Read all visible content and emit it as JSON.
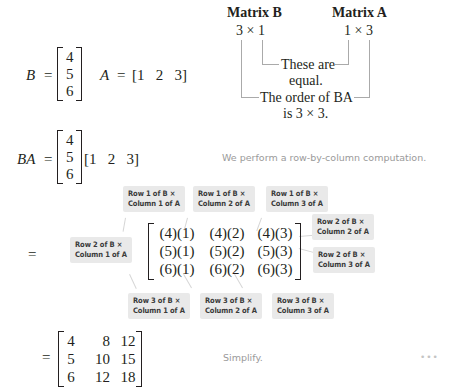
{
  "definition": {
    "B_label": "B",
    "B_values": [
      "4",
      "5",
      "6"
    ],
    "A_label": "A",
    "A_row": "[1   2   3]",
    "equals": "="
  },
  "order_diagram": {
    "matrix_b_title": "Matrix B",
    "matrix_a_title": "Matrix A",
    "matrix_b_order": "3 × 1",
    "matrix_a_order": "1 × 3",
    "inner_note_line1": "These are",
    "inner_note_line2": "equal.",
    "outer_note_line1": "The order of BA",
    "outer_note_line2": "is 3 × 3."
  },
  "product_step": {
    "lhs": "BA",
    "equals": "=",
    "B_values": [
      "4",
      "5",
      "6"
    ],
    "A_row": "[1   2   3]",
    "note": "We perform a row-by-column computation."
  },
  "expanded_step": {
    "equals": "=",
    "cells": [
      [
        "(4)(1)",
        "(4)(2)",
        "(4)(3)"
      ],
      [
        "(5)(1)",
        "(5)(2)",
        "(5)(3)"
      ],
      [
        "(6)(1)",
        "(6)(2)",
        "(6)(3)"
      ]
    ],
    "tags": {
      "r1c1": {
        "line1": "Row 1 of B ×",
        "line2": "Column 1 of A"
      },
      "r1c2": {
        "line1": "Row 1 of B ×",
        "line2": "Column 2 of A"
      },
      "r1c3": {
        "line1": "Row 1 of B ×",
        "line2": "Column 3 of A"
      },
      "r2c1": {
        "line1": "Row 2 of B ×",
        "line2": "Column 1 of A"
      },
      "r2c2": {
        "line1": "Row 2 of B ×",
        "line2": "Column 2 of A"
      },
      "r2c3": {
        "line1": "Row 2 of B ×",
        "line2": "Column 3 of A"
      },
      "r3c1": {
        "line1": "Row 3 of B ×",
        "line2": "Column 1 of A"
      },
      "r3c2": {
        "line1": "Row 3 of B ×",
        "line2": "Column 2 of A"
      },
      "r3c3": {
        "line1": "Row 3 of B ×",
        "line2": "Column 3 of A"
      }
    }
  },
  "result_step": {
    "equals": "=",
    "cells": [
      [
        "4",
        "8",
        "12"
      ],
      [
        "5",
        "10",
        "15"
      ],
      [
        "6",
        "12",
        "18"
      ]
    ],
    "note": "Simplify.",
    "more_indicator": "•••"
  }
}
